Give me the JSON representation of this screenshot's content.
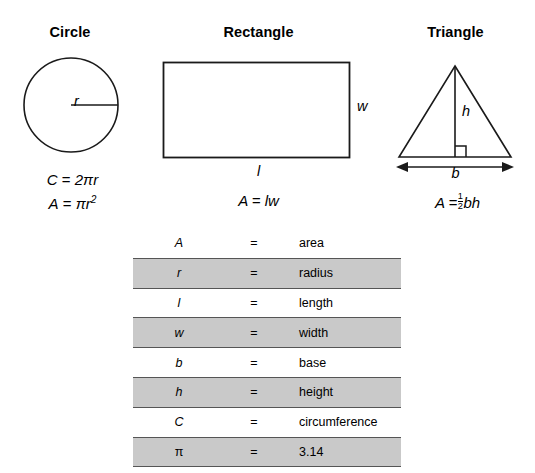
{
  "figures": [
    {
      "id": "circle",
      "title": "Circle",
      "label": "r",
      "formulas": [
        "C = 2πr",
        "A = πr²"
      ]
    },
    {
      "id": "rectangle",
      "title": "Rectangle",
      "label_width": "w",
      "label_length": "l",
      "formula": "A = lw"
    },
    {
      "id": "triangle",
      "title": "Triangle",
      "label_height": "h",
      "label_base": "b",
      "formula": "A = ½bh"
    }
  ],
  "figure_titles": {
    "circle": "Circle",
    "rectangle": "Rectangle",
    "triangle": "Triangle"
  },
  "labels": {
    "radius": "r",
    "width": "w",
    "length": "l",
    "base": "b",
    "height": "h"
  },
  "formulas": {
    "circumference_lhs": "C",
    "circumference_rhs": "2πr",
    "circle_area_lhs": "A",
    "circle_area_rhs": "πr",
    "circle_area_exp": "2",
    "rectangle_area": "A = lw",
    "triangle_area_lhs": "A =",
    "triangle_frac_num": "1",
    "triangle_frac_den": "2",
    "triangle_area_rhs": "bh"
  },
  "legend": {
    "columns": [
      "symbol",
      "equals",
      "description"
    ],
    "rows": [
      {
        "symbol": "A",
        "equals": "=",
        "description": "area",
        "shaded": false,
        "upright": false
      },
      {
        "symbol": "r",
        "equals": "=",
        "description": "radius",
        "shaded": true,
        "upright": false
      },
      {
        "symbol": "l",
        "equals": "=",
        "description": "length",
        "shaded": false,
        "upright": false
      },
      {
        "symbol": "w",
        "equals": "=",
        "description": "width",
        "shaded": true,
        "upright": false
      },
      {
        "symbol": "b",
        "equals": "=",
        "description": "base",
        "shaded": false,
        "upright": false
      },
      {
        "symbol": "h",
        "equals": "=",
        "description": "height",
        "shaded": true,
        "upright": false
      },
      {
        "symbol": "C",
        "equals": "=",
        "description": "circumference",
        "shaded": false,
        "upright": false
      },
      {
        "symbol": "π",
        "equals": "=",
        "description": "3.14",
        "shaded": true,
        "upright": true
      }
    ]
  },
  "colors": {
    "stroke": "#1a1a1a",
    "shaded_row": "#c9c9c9",
    "row_border": "#555555",
    "background": "#ffffff"
  }
}
